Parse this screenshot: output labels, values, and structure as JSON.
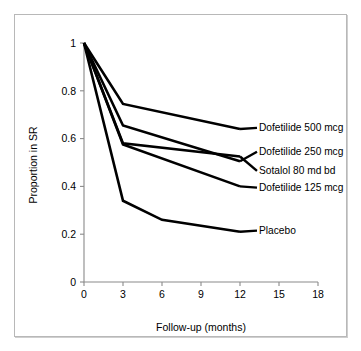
{
  "chart_data": {
    "type": "line",
    "title": "",
    "xlabel": "Follow-up (months)",
    "ylabel": "Proportion in SR",
    "xlim": [
      0,
      18
    ],
    "ylim": [
      0,
      1
    ],
    "xticks": [
      "0",
      "3",
      "6",
      "9",
      "12",
      "15",
      "18"
    ],
    "xtick_values": [
      0,
      3,
      6,
      9,
      12,
      15,
      18
    ],
    "yticks": [
      "0",
      "0.2",
      "0.4",
      "0.6",
      "0.8",
      "1"
    ],
    "ytick_values": [
      0,
      0.2,
      0.4,
      0.6,
      0.8,
      1
    ],
    "grid": false,
    "legend_position": "right-inline-labels",
    "line_color": "#000000",
    "series": [
      {
        "name": "Dofetilide 500 mcg",
        "x": [
          0,
          3,
          12
        ],
        "values": [
          1.0,
          0.745,
          0.64
        ],
        "label_x": 12,
        "label_y": 0.645
      },
      {
        "name": "Dofetilide 250 mcg",
        "x": [
          0,
          3,
          12
        ],
        "values": [
          1.0,
          0.655,
          0.505
        ],
        "label_x": 12,
        "label_y": 0.545
      },
      {
        "name": "Sotalol 80 md bd",
        "x": [
          0,
          3,
          12
        ],
        "values": [
          1.0,
          0.58,
          0.525
        ],
        "label_x": 12,
        "label_y": 0.465
      },
      {
        "name": "Dofetilide 125 mcg",
        "x": [
          0,
          3,
          12
        ],
        "values": [
          1.0,
          0.575,
          0.4
        ],
        "label_x": 12,
        "label_y": 0.395
      },
      {
        "name": "Placebo",
        "x": [
          0,
          3,
          6,
          12
        ],
        "values": [
          1.0,
          0.34,
          0.26,
          0.21
        ],
        "label_x": 12,
        "label_y": 0.215
      }
    ]
  }
}
